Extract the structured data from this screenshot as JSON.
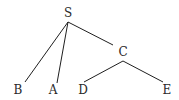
{
  "diagram": {
    "type": "tree",
    "nodes": [
      {
        "id": "S",
        "label": "S",
        "x": 68,
        "y": 13
      },
      {
        "id": "C",
        "label": "C",
        "x": 123,
        "y": 52
      },
      {
        "id": "B",
        "label": "B",
        "x": 18,
        "y": 90
      },
      {
        "id": "A",
        "label": "A",
        "x": 53,
        "y": 90
      },
      {
        "id": "D",
        "label": "D",
        "x": 83,
        "y": 90
      },
      {
        "id": "E",
        "label": "E",
        "x": 167,
        "y": 90
      }
    ],
    "edges": [
      {
        "from": "S",
        "to": "B",
        "x1": 68,
        "y1": 22,
        "x2": 25,
        "y2": 82
      },
      {
        "from": "S",
        "to": "A",
        "x1": 68,
        "y1": 22,
        "x2": 57,
        "y2": 83
      },
      {
        "from": "S",
        "to": "C",
        "x1": 68,
        "y1": 22,
        "x2": 113,
        "y2": 45
      },
      {
        "from": "C",
        "to": "D",
        "x1": 123,
        "y1": 61,
        "x2": 84,
        "y2": 82
      },
      {
        "from": "C",
        "to": "E",
        "x1": 123,
        "y1": 61,
        "x2": 163,
        "y2": 82
      }
    ],
    "colors": {
      "line": "#1f1f1f",
      "text": "#2a2a2a",
      "background": "#ffffff"
    }
  }
}
